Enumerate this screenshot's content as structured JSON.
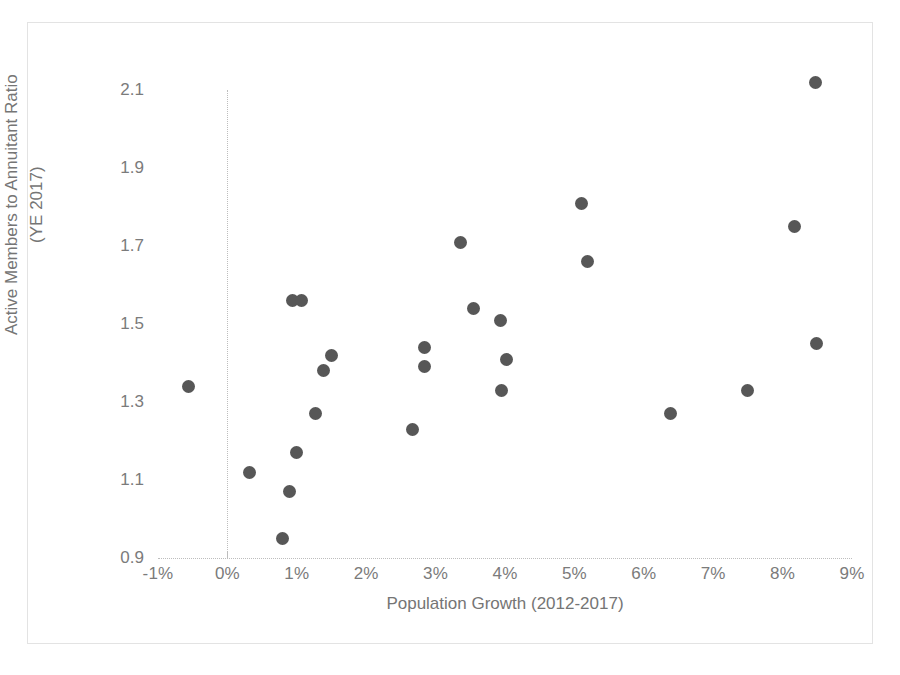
{
  "chart_data": {
    "type": "scatter",
    "title": "",
    "xlabel": "Population Growth (2012-2017)",
    "ylabel_line1": "Active Members to Annuitant Ratio",
    "ylabel_line2": "(YE 2017)",
    "xlim": [
      -1,
      9
    ],
    "ylim": [
      0.9,
      2.1
    ],
    "xticks": [
      -1,
      0,
      1,
      2,
      3,
      4,
      5,
      6,
      7,
      8,
      9
    ],
    "xtick_labels": [
      "-1%",
      "0%",
      "1%",
      "2%",
      "3%",
      "4%",
      "5%",
      "6%",
      "7%",
      "8%",
      "9%"
    ],
    "yticks": [
      0.9,
      1.1,
      1.3,
      1.5,
      1.7,
      1.9,
      2.1
    ],
    "ytick_labels": [
      "0.9",
      "1.1",
      "1.3",
      "1.5",
      "1.7",
      "1.9",
      "2.1"
    ],
    "grid": false,
    "legend": "none",
    "marker_color": "#575757",
    "axis_color": "#bdbdbd",
    "text_color": "#757575",
    "points": [
      {
        "x": -0.56,
        "y": 1.34
      },
      {
        "x": 0.32,
        "y": 1.12
      },
      {
        "x": 0.79,
        "y": 0.95
      },
      {
        "x": 0.9,
        "y": 1.07
      },
      {
        "x": 0.94,
        "y": 1.56
      },
      {
        "x": 1.07,
        "y": 1.56
      },
      {
        "x": 1.0,
        "y": 1.17
      },
      {
        "x": 1.27,
        "y": 1.27
      },
      {
        "x": 1.38,
        "y": 1.38
      },
      {
        "x": 1.5,
        "y": 1.42
      },
      {
        "x": 2.66,
        "y": 1.23
      },
      {
        "x": 2.84,
        "y": 1.44
      },
      {
        "x": 2.84,
        "y": 1.39
      },
      {
        "x": 3.36,
        "y": 1.71
      },
      {
        "x": 3.55,
        "y": 1.54
      },
      {
        "x": 3.94,
        "y": 1.51
      },
      {
        "x": 4.02,
        "y": 1.41
      },
      {
        "x": 3.95,
        "y": 1.33
      },
      {
        "x": 5.1,
        "y": 1.81
      },
      {
        "x": 5.19,
        "y": 1.66
      },
      {
        "x": 6.39,
        "y": 1.27
      },
      {
        "x": 7.5,
        "y": 1.33
      },
      {
        "x": 8.17,
        "y": 1.75
      },
      {
        "x": 8.48,
        "y": 2.12
      },
      {
        "x": 8.49,
        "y": 1.45
      }
    ]
  }
}
